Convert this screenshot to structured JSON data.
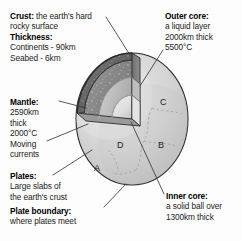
{
  "figure": {
    "background_color": "#fdfdfd",
    "text_color": "#1b1b1b"
  },
  "callouts": {
    "crust": {
      "heading": "Crust:",
      "line1_rest": " the earth's hard",
      "line2": "rocky surface",
      "heading2": "Thickness:",
      "line3": "Continents - 90km",
      "line4": "Seabed - 6km"
    },
    "mantle": {
      "heading": "Mantle:",
      "line1": "2590km",
      "line2": "thick",
      "line3": "2000°C"
    },
    "currents": {
      "line1": "Moving",
      "line2": "currents"
    },
    "plates": {
      "heading": "Plates:",
      "line1": "Large slabs of",
      "line2": "the earth's crust"
    },
    "plate_boundary": {
      "heading": "Plate boundary:",
      "line1": "where plates meet"
    },
    "outer_core": {
      "heading": "Outer core:",
      "line1": "a liquid layer",
      "line2": "2000km thick",
      "line3": "5500°C"
    },
    "inner_core": {
      "heading": "Inner core:",
      "line1": "a solid ball over",
      "line2": "1300km thick"
    }
  },
  "globe_letters": {
    "a": "A",
    "b": "B",
    "c": "C",
    "d": "D"
  },
  "colors": {
    "sphere_light": "#d9d9d9",
    "sphere_mid": "#c4c4c4",
    "crust_dark": "#6d6d6d",
    "mantle_dark": "#8a8a8a",
    "outer_core_gray": "#b5b5b5",
    "inner_core_light": "#ededed",
    "outline": "#2a2a2a",
    "leader_line": "#3a3a3a"
  }
}
